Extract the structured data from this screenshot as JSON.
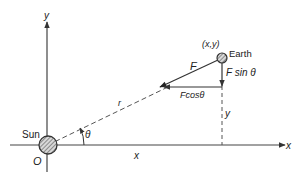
{
  "diagram": {
    "title": "",
    "axes": {
      "x_label": "x",
      "y_label": "y",
      "origin_label": "O"
    },
    "bodies": {
      "sun_label": "Sun",
      "earth_label": "Earth",
      "earth_coords_label": "(x,y)"
    },
    "vectors": {
      "force_label": "F",
      "force_x_label": "Fcosθ",
      "force_y_label": "F sin θ"
    },
    "distances": {
      "radius_label": "r",
      "x_distance_label": "x",
      "y_distance_label": "y"
    },
    "angle_label": "θ",
    "colors": {
      "line": "#333333",
      "sun_fill": "#9a9a9a",
      "earth_fill": "#8a8a8a"
    }
  }
}
